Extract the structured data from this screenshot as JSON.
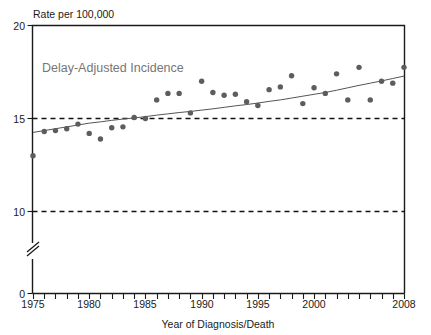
{
  "chart_data": {
    "type": "scatter",
    "title": "",
    "subtitle": "",
    "ylabel": "Rate per 100,000",
    "xlabel": "Year of Diagnosis/Death",
    "annotation": "Delay-Adjusted Incidence",
    "grid": false,
    "legend": "none",
    "xlim": [
      1975,
      2008
    ],
    "ylim": [
      0,
      20
    ],
    "y_axis_break": true,
    "y_break_between": [
      0,
      10
    ],
    "y_tick_labels": [
      "0",
      "10",
      "15",
      "20"
    ],
    "y_tick_values": [
      0,
      10,
      15,
      20
    ],
    "x_tick_labels": [
      "1975",
      "1980",
      "1985",
      "1990",
      "1995",
      "2000",
      "2008"
    ],
    "x_tick_values": [
      1975,
      1980,
      1985,
      1990,
      1995,
      2000,
      2008
    ],
    "x_minor_tick_interval": 1,
    "reference_lines": [
      {
        "value": 15,
        "style": "dashed"
      },
      {
        "value": 10,
        "style": "dashed"
      }
    ],
    "x": [
      1975,
      1976,
      1977,
      1978,
      1979,
      1980,
      1981,
      1982,
      1983,
      1984,
      1985,
      1986,
      1987,
      1988,
      1989,
      1990,
      1991,
      1992,
      1993,
      1994,
      1995,
      1996,
      1997,
      1998,
      1999,
      2000,
      2001,
      2002,
      2003,
      2004,
      2005,
      2006,
      2007,
      2008
    ],
    "series": [
      {
        "name": "Delay-Adjusted Incidence",
        "marker": "circle",
        "color": "#5d5d5d",
        "values": [
          13.0,
          14.3,
          14.35,
          14.45,
          14.7,
          14.2,
          13.9,
          14.5,
          14.55,
          15.05,
          15.0,
          16.0,
          16.35,
          16.35,
          15.3,
          17.0,
          16.4,
          16.25,
          16.3,
          15.9,
          15.7,
          16.55,
          16.7,
          17.3,
          15.8,
          16.65,
          16.35,
          17.4,
          16.0,
          17.75,
          16.0,
          17.0,
          16.9,
          17.75
        ]
      },
      {
        "name": "Trend line",
        "marker": "none",
        "color": "#555555",
        "values": [
          14.25,
          14.35,
          14.45,
          14.55,
          14.65,
          14.75,
          14.82,
          14.9,
          14.97,
          15.03,
          15.1,
          15.18,
          15.25,
          15.32,
          15.38,
          15.45,
          15.52,
          15.6,
          15.68,
          15.75,
          15.83,
          15.92,
          16.0,
          16.1,
          16.2,
          16.3,
          16.4,
          16.52,
          16.65,
          16.78,
          16.9,
          17.02,
          17.15,
          17.28
        ]
      }
    ]
  },
  "axis": {
    "y_title": "Rate per 100,000",
    "x_title": "Year of Diagnosis/Death"
  },
  "annotation": {
    "text": "Delay-Adjusted Incidence"
  },
  "colors": {
    "dot": "#5d5d5d",
    "trend": "#555555",
    "annotation": "#767676",
    "axis": "#1a1a1a",
    "background": "#ffffff"
  }
}
